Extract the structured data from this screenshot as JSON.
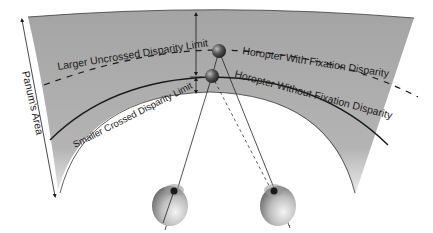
{
  "diagram": {
    "labels": {
      "larger_uncrossed": "Larger Uncrossed Disparity Limit",
      "smaller_crossed": "Smaller Crossed Disparity Limit",
      "horopter_with": "Horopter With Fixation Disparity",
      "horopter_without": "Horopter Without Fixation Disparity",
      "panums_area": "Panum's Area"
    },
    "colors": {
      "band": "#9a9a9a",
      "band_light": "#e6e6e6",
      "line": "#1a1a1a",
      "eye": "#8a8a8a"
    }
  }
}
